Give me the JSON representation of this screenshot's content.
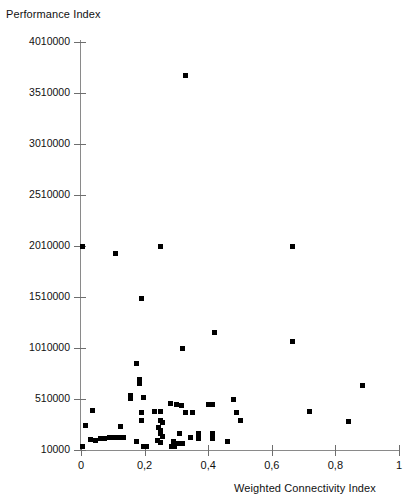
{
  "chart_data": {
    "type": "scatter",
    "title": "",
    "ylabel": "Performance Index",
    "xlabel": "Weighted Connectivity Index",
    "xlim": [
      0,
      1
    ],
    "ylim": [
      10000,
      4010000
    ],
    "grid": false,
    "legend": null,
    "marker": {
      "shape": "square",
      "color": "#000000",
      "size": 5
    },
    "x_ticks": [
      {
        "value": 0,
        "label": "0"
      },
      {
        "value": 0.2,
        "label": "0,2"
      },
      {
        "value": 0.4,
        "label": "0,4"
      },
      {
        "value": 0.6,
        "label": "0,6"
      },
      {
        "value": 0.8,
        "label": "0,8"
      },
      {
        "value": 1.0,
        "label": "1"
      }
    ],
    "y_ticks": [
      {
        "value": 10000,
        "label": "10000"
      },
      {
        "value": 510000,
        "label": "510000"
      },
      {
        "value": 1010000,
        "label": "1010000"
      },
      {
        "value": 1510000,
        "label": "1510000"
      },
      {
        "value": 2010000,
        "label": "2010000"
      },
      {
        "value": 2510000,
        "label": "2510000"
      },
      {
        "value": 3010000,
        "label": "3010000"
      },
      {
        "value": 3510000,
        "label": "3510000"
      },
      {
        "value": 4010000,
        "label": "4010000"
      }
    ],
    "points": [
      {
        "x": 0.33,
        "y": 3680000
      },
      {
        "x": 0.005,
        "y": 2010000
      },
      {
        "x": 0.11,
        "y": 1940000
      },
      {
        "x": 0.25,
        "y": 2010000
      },
      {
        "x": 0.665,
        "y": 2010000
      },
      {
        "x": 0.19,
        "y": 1500000
      },
      {
        "x": 0.42,
        "y": 1160000
      },
      {
        "x": 0.665,
        "y": 1070000
      },
      {
        "x": 0.32,
        "y": 1010000
      },
      {
        "x": 0.175,
        "y": 860000
      },
      {
        "x": 0.185,
        "y": 700000
      },
      {
        "x": 0.185,
        "y": 660000
      },
      {
        "x": 0.885,
        "y": 640000
      },
      {
        "x": 0.155,
        "y": 545000
      },
      {
        "x": 0.155,
        "y": 515000
      },
      {
        "x": 0.195,
        "y": 520000
      },
      {
        "x": 0.48,
        "y": 505000
      },
      {
        "x": 0.28,
        "y": 465000
      },
      {
        "x": 0.3,
        "y": 455000
      },
      {
        "x": 0.315,
        "y": 450000
      },
      {
        "x": 0.4,
        "y": 460000
      },
      {
        "x": 0.415,
        "y": 455000
      },
      {
        "x": 0.035,
        "y": 395000
      },
      {
        "x": 0.23,
        "y": 390000
      },
      {
        "x": 0.25,
        "y": 385000
      },
      {
        "x": 0.19,
        "y": 375000
      },
      {
        "x": 0.33,
        "y": 380000
      },
      {
        "x": 0.35,
        "y": 375000
      },
      {
        "x": 0.49,
        "y": 375000
      },
      {
        "x": 0.72,
        "y": 385000
      },
      {
        "x": 0.84,
        "y": 290000
      },
      {
        "x": 0.19,
        "y": 300000
      },
      {
        "x": 0.25,
        "y": 295000
      },
      {
        "x": 0.255,
        "y": 275000
      },
      {
        "x": 0.5,
        "y": 300000
      },
      {
        "x": 0.015,
        "y": 250000
      },
      {
        "x": 0.125,
        "y": 245000
      },
      {
        "x": 0.245,
        "y": 230000
      },
      {
        "x": 0.25,
        "y": 200000
      },
      {
        "x": 0.25,
        "y": 170000
      },
      {
        "x": 0.255,
        "y": 140000
      },
      {
        "x": 0.31,
        "y": 170000
      },
      {
        "x": 0.37,
        "y": 170000
      },
      {
        "x": 0.415,
        "y": 175000
      },
      {
        "x": 0.03,
        "y": 115000
      },
      {
        "x": 0.045,
        "y": 105000
      },
      {
        "x": 0.06,
        "y": 120000
      },
      {
        "x": 0.075,
        "y": 125000
      },
      {
        "x": 0.09,
        "y": 130000
      },
      {
        "x": 0.105,
        "y": 130000
      },
      {
        "x": 0.12,
        "y": 130000
      },
      {
        "x": 0.135,
        "y": 130000
      },
      {
        "x": 0.175,
        "y": 95000
      },
      {
        "x": 0.24,
        "y": 100000
      },
      {
        "x": 0.25,
        "y": 80000
      },
      {
        "x": 0.29,
        "y": 95000
      },
      {
        "x": 0.305,
        "y": 75000
      },
      {
        "x": 0.32,
        "y": 70000
      },
      {
        "x": 0.345,
        "y": 130000
      },
      {
        "x": 0.37,
        "y": 125000
      },
      {
        "x": 0.415,
        "y": 125000
      },
      {
        "x": 0.46,
        "y": 95000
      },
      {
        "x": 0.005,
        "y": 40000
      },
      {
        "x": 0.195,
        "y": 45000
      },
      {
        "x": 0.205,
        "y": 40000
      },
      {
        "x": 0.285,
        "y": 45000
      },
      {
        "x": 0.295,
        "y": 40000
      }
    ]
  }
}
